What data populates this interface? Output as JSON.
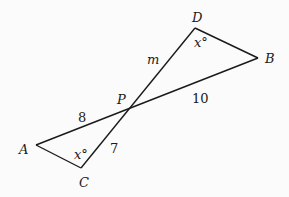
{
  "diagram": {
    "points": {
      "A": {
        "label": "A",
        "x": 36,
        "y": 145
      },
      "B": {
        "label": "B",
        "x": 258,
        "y": 58
      },
      "C": {
        "label": "C",
        "x": 81,
        "y": 168
      },
      "D": {
        "label": "D",
        "x": 195,
        "y": 28
      },
      "P": {
        "label": "P",
        "x": 132,
        "y": 107
      }
    },
    "segments": [
      {
        "from": "A",
        "to": "B"
      },
      {
        "from": "C",
        "to": "D"
      },
      {
        "from": "A",
        "to": "C"
      },
      {
        "from": "D",
        "to": "B"
      }
    ],
    "labels": {
      "m": "m",
      "ten": "10",
      "eight": "8",
      "seven": "7",
      "angle_D": "x°",
      "angle_C": "x°"
    },
    "colors": {
      "line": "#1a1a1a",
      "background": "#fbfbfb"
    }
  }
}
